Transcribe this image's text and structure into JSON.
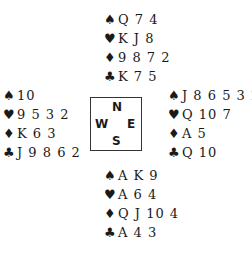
{
  "suits": {
    "spades": "♠",
    "hearts": "♥",
    "diamonds": "♦",
    "clubs": "♣"
  },
  "compass": {
    "north": "N",
    "west": "W",
    "east": "E",
    "south": "S"
  },
  "hands": {
    "north": {
      "spades": "Q 7 4",
      "hearts": "K J 8",
      "diamonds": "9 8 7 2",
      "clubs": "K 7 5"
    },
    "west": {
      "spades": "10",
      "hearts": "9 5 3 2",
      "diamonds": "K 6 3",
      "clubs": "J 9 8 6 2"
    },
    "east": {
      "spades": "J 8 6 5 3 2",
      "hearts": "Q 10 7",
      "diamonds": "A 5",
      "clubs": "Q 10"
    },
    "south": {
      "spades": "A K 9",
      "hearts": "A 6 4",
      "diamonds": "Q J 10 4",
      "clubs": "A 4 3"
    }
  }
}
